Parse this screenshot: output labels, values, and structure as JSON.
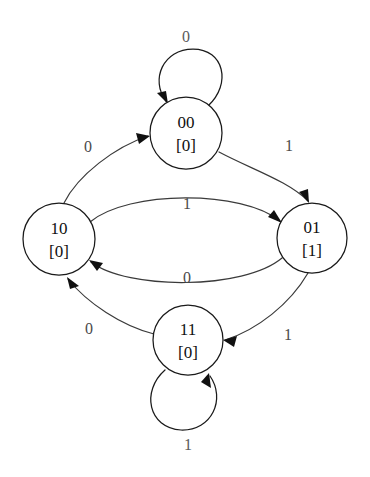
{
  "diagram": {
    "kind": "finite-state-machine",
    "title": "",
    "background_color": "#ffffff",
    "stroke_color": "#1a1a1a",
    "label_color": "#4a4a4a",
    "text_color": "#101010"
  },
  "states": [
    {
      "id": "00",
      "name": "00",
      "output": "[0]",
      "cx": 186,
      "cy": 133,
      "r": 36
    },
    {
      "id": "10",
      "name": "10",
      "output": "[0]",
      "cx": 59,
      "cy": 239,
      "r": 36
    },
    {
      "id": "01",
      "name": "01",
      "output": "[1]",
      "cx": 312,
      "cy": 238,
      "r": 35
    },
    {
      "id": "11",
      "name": "11",
      "output": "[0]",
      "cx": 188,
      "cy": 340,
      "r": 35
    }
  ],
  "transitions": [
    {
      "id": "t-00-00",
      "from": "00",
      "to": "00",
      "input": "0",
      "kind": "self-loop",
      "label_x": 186,
      "label_y": 38
    },
    {
      "id": "t-10-00",
      "from": "10",
      "to": "00",
      "input": "0",
      "kind": "curve",
      "label_x": 88,
      "label_y": 148
    },
    {
      "id": "t-00-01",
      "from": "00",
      "to": "01",
      "input": "1",
      "kind": "curve",
      "label_x": 289,
      "label_y": 147
    },
    {
      "id": "t-10-01",
      "from": "10",
      "to": "01",
      "input": "1",
      "kind": "curve",
      "label_x": 187,
      "label_y": 205
    },
    {
      "id": "t-01-10",
      "from": "01",
      "to": "10",
      "input": "0",
      "kind": "curve",
      "label_x": 187,
      "label_y": 279
    },
    {
      "id": "t-01-11",
      "from": "01",
      "to": "11",
      "input": "1",
      "kind": "curve",
      "label_x": 288,
      "label_y": 336
    },
    {
      "id": "t-11-10",
      "from": "11",
      "to": "10",
      "input": "0",
      "kind": "curve",
      "label_x": 89,
      "label_y": 330
    },
    {
      "id": "t-11-11",
      "from": "11",
      "to": "11",
      "input": "1",
      "kind": "self-loop",
      "label_x": 188,
      "label_y": 446
    }
  ]
}
